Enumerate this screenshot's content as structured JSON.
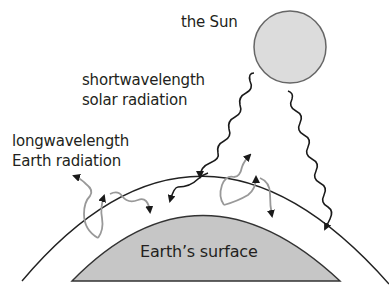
{
  "labels": {
    "sun": "the Sun",
    "short_line1": "shortwavelength",
    "short_line2": "solar radiation",
    "long_line1": "longwavelength",
    "long_line2": "Earth radiation",
    "surface": "Earth’s surface"
  },
  "colors": {
    "sun_fill": "#dcdcdc",
    "sun_stroke": "#666666",
    "earth_fill": "#c6c6c6",
    "solar_wave": "#1a1a1a",
    "earth_wave": "#9a9a9a",
    "atmosphere_line": "#222222"
  },
  "icons": {
    "sun": "sun-icon",
    "shortwave_arrow": "wavy-arrow-icon",
    "longwave_arrow": "curved-arrow-icon"
  }
}
